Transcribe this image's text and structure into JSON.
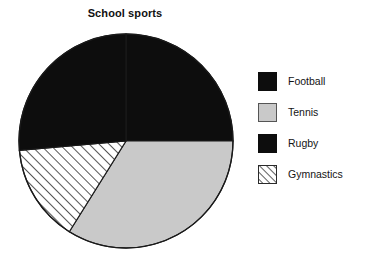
{
  "chart_data": {
    "type": "pie",
    "title": "School sports",
    "xlabel": "",
    "ylabel": "",
    "categories": [
      "Football",
      "Tennis",
      "Rugby",
      "Gymnastics"
    ],
    "values": [
      25,
      34,
      26,
      15
    ],
    "units": "percent",
    "start_angle_deg": 0,
    "direction": "clockwise",
    "grid": false,
    "legend_position": "right",
    "slices": [
      {
        "label": "Football",
        "value": 25,
        "start_angle_deg": 0,
        "end_angle_deg": 90,
        "fill": "#0d0d0d",
        "pattern": "solid",
        "swatch": "solid-black"
      },
      {
        "label": "Tennis",
        "value": 34,
        "start_angle_deg": 90,
        "end_angle_deg": 212,
        "fill": "#c9c9c9",
        "pattern": "solid",
        "swatch": "solid-gray"
      },
      {
        "label": "Gymnastics",
        "value": 15,
        "start_angle_deg": 212,
        "end_angle_deg": 265,
        "fill": "#ffffff",
        "pattern": "diagonal-hatch-forward",
        "swatch": "hatch"
      },
      {
        "label": "Rugby",
        "value": 26,
        "start_angle_deg": 265,
        "end_angle_deg": 360,
        "fill": "#0d0d0d",
        "pattern": "solid",
        "swatch": "solid-black"
      }
    ],
    "geometry": {
      "center_x": 112,
      "center_y": 111,
      "radius": 107,
      "outline_color": "#1a1a1a"
    }
  },
  "legend": {
    "items": [
      {
        "label": "Football",
        "swatch": "solid-black",
        "color": "#0d0d0d"
      },
      {
        "label": "Tennis",
        "swatch": "solid-gray",
        "color": "#c9c9c9"
      },
      {
        "label": "Rugby",
        "swatch": "solid-black",
        "color": "#0d0d0d"
      },
      {
        "label": "Gymnastics",
        "swatch": "hatch",
        "color": "#ffffff"
      }
    ]
  },
  "colors": {
    "football": "#0d0d0d",
    "tennis": "#c9c9c9",
    "rugby": "#0d0d0d",
    "gymnastics": "#ffffff",
    "outline": "#1a1a1a",
    "background": "#ffffff",
    "text": "#141414"
  }
}
